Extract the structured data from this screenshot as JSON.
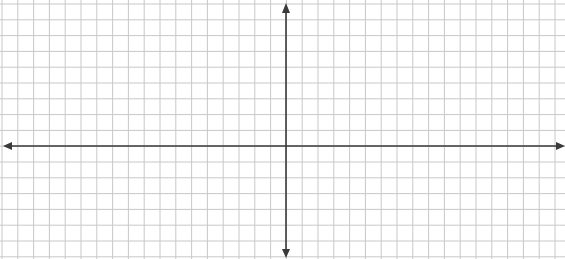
{
  "diagram": {
    "type": "coordinate-plane",
    "width": 565,
    "height": 259,
    "grid": {
      "spacing_px": 15.8,
      "x_offset": 2,
      "y_offset": 4,
      "color": "#c8c8c8",
      "line_width": 1
    },
    "axes": {
      "color": "#3a3a3a",
      "line_width": 1.6,
      "x_axis_y": 146,
      "y_axis_x": 286,
      "x_axis_labels": [],
      "y_axis_labels": []
    },
    "background": "#ffffff"
  }
}
